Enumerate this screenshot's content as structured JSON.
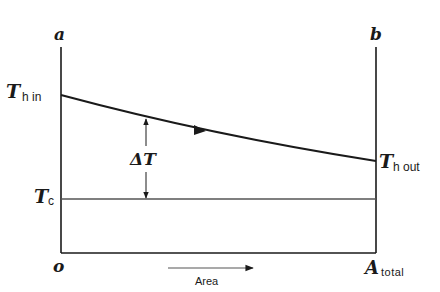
{
  "diagram": {
    "axes": {
      "left_label": "a",
      "right_label": "b",
      "origin_label": "o",
      "end_label_main": "A",
      "end_label_sub": "total",
      "x_direction_label": "Area"
    },
    "curves": {
      "hot": {
        "label_start_main": "T",
        "label_start_sub": "h in",
        "label_end_main": "T",
        "label_end_sub": "h out",
        "flow_direction": "left-to-right"
      },
      "cold": {
        "label_main": "T",
        "label_sub": "c",
        "shape": "horizontal"
      }
    },
    "difference": {
      "label": "ΔT"
    },
    "colors": {
      "line": "#1a1a1a",
      "cold_line": "#555555",
      "background": "#ffffff"
    }
  }
}
